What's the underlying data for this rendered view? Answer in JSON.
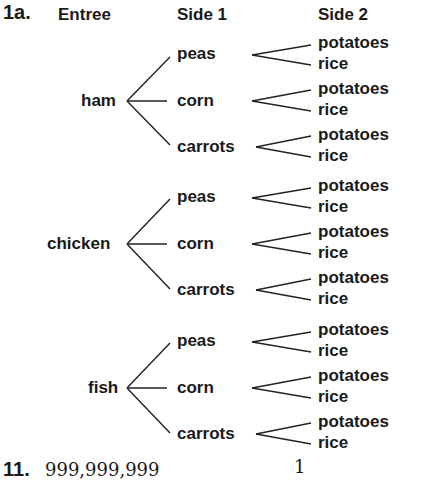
{
  "problem_label": "1a.",
  "headers": {
    "entree": "Entree",
    "side1": "Side 1",
    "side2": "Side 2"
  },
  "tree": [
    {
      "entree": "ham",
      "sides": [
        {
          "side1": "peas",
          "side2": [
            "potatoes",
            "rice"
          ]
        },
        {
          "side1": "corn",
          "side2": [
            "potatoes",
            "rice"
          ]
        },
        {
          "side1": "carrots",
          "side2": [
            "potatoes",
            "rice"
          ]
        }
      ]
    },
    {
      "entree": "chicken",
      "sides": [
        {
          "side1": "peas",
          "side2": [
            "potatoes",
            "rice"
          ]
        },
        {
          "side1": "corn",
          "side2": [
            "potatoes",
            "rice"
          ]
        },
        {
          "side1": "carrots",
          "side2": [
            "potatoes",
            "rice"
          ]
        }
      ]
    },
    {
      "entree": "fish",
      "sides": [
        {
          "side1": "peas",
          "side2": [
            "potatoes",
            "rice"
          ]
        },
        {
          "side1": "corn",
          "side2": [
            "potatoes",
            "rice"
          ]
        },
        {
          "side1": "carrots",
          "side2": [
            "potatoes",
            "rice"
          ]
        }
      ]
    }
  ],
  "footer": {
    "problem_label": "11.",
    "value": "999,999,999",
    "fraction_numerator": "1"
  }
}
